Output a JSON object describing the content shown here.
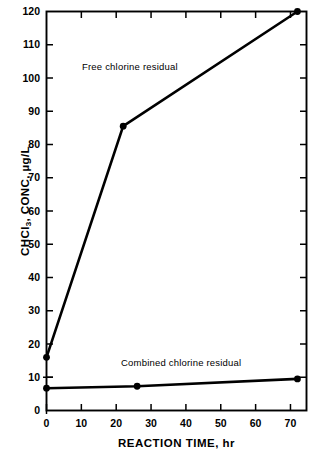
{
  "chart_data": {
    "type": "line",
    "title": "",
    "xlabel": "REACTION TIME, hr",
    "ylabel": "CHCl3, CONC, µg/L",
    "ylabel_prefix": "CHCl",
    "ylabel_subscript": "3",
    "ylabel_suffix": ", CONC, µg/L",
    "xlim": [
      0,
      74.6
    ],
    "ylim": [
      0,
      120
    ],
    "xticks": [
      0,
      10,
      20,
      30,
      40,
      50,
      60,
      70
    ],
    "xtick_labels": [
      "0",
      "10",
      "20",
      "30",
      "40",
      "50",
      "60",
      "70"
    ],
    "yticks": [
      0,
      10,
      20,
      30,
      40,
      50,
      60,
      70,
      80,
      90,
      100,
      110,
      120
    ],
    "ytick_labels": [
      "0",
      "10",
      "20",
      "30",
      "40",
      "50",
      "60",
      "70",
      "80",
      "90",
      "100",
      "110",
      "120"
    ],
    "grid": false,
    "legend_position": "inline-annotations",
    "marker": "filled-circle",
    "line_color": "#000000",
    "background_color": "#ffffff",
    "series": [
      {
        "name": "Free chlorine residual",
        "annotation": "Free chlorine residual",
        "x": [
          0,
          22,
          72
        ],
        "y": [
          16,
          85.5,
          120
        ]
      },
      {
        "name": "Combined chlorine residual",
        "annotation": "Combined chlorine residual",
        "x": [
          0,
          26,
          72
        ],
        "y": [
          6.7,
          7.3,
          9.5
        ]
      }
    ]
  }
}
